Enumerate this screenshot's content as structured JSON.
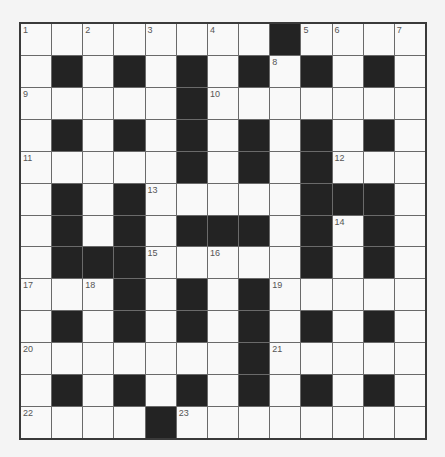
{
  "puzzle": {
    "rows": 13,
    "cols": 13,
    "grid": [
      "........#....",
      ".#.#.#.#.#.#.",
      ".....#.......",
      ".#.#.#.#.#.#.",
      ".....#.#.#...",
      ".#.#.....###.",
      ".#.#.###.#.#.",
      ".###.....#.#.",
      "...#.#.#.....",
      ".#.#.#.#.#.#.",
      ".......#.....",
      ".#.#.#.#.#.#.",
      "....#........"
    ],
    "numbers": [
      {
        "r": 0,
        "c": 0,
        "n": "1"
      },
      {
        "r": 0,
        "c": 2,
        "n": "2"
      },
      {
        "r": 0,
        "c": 4,
        "n": "3"
      },
      {
        "r": 0,
        "c": 6,
        "n": "4"
      },
      {
        "r": 0,
        "c": 9,
        "n": "5"
      },
      {
        "r": 0,
        "c": 10,
        "n": "6"
      },
      {
        "r": 0,
        "c": 12,
        "n": "7"
      },
      {
        "r": 1,
        "c": 8,
        "n": "8"
      },
      {
        "r": 2,
        "c": 0,
        "n": "9"
      },
      {
        "r": 2,
        "c": 6,
        "n": "10"
      },
      {
        "r": 4,
        "c": 0,
        "n": "11"
      },
      {
        "r": 4,
        "c": 10,
        "n": "12"
      },
      {
        "r": 5,
        "c": 4,
        "n": "13"
      },
      {
        "r": 6,
        "c": 10,
        "n": "14"
      },
      {
        "r": 7,
        "c": 4,
        "n": "15"
      },
      {
        "r": 7,
        "c": 6,
        "n": "16"
      },
      {
        "r": 8,
        "c": 0,
        "n": "17"
      },
      {
        "r": 8,
        "c": 2,
        "n": "18"
      },
      {
        "r": 8,
        "c": 8,
        "n": "19"
      },
      {
        "r": 10,
        "c": 0,
        "n": "20"
      },
      {
        "r": 10,
        "c": 8,
        "n": "21"
      },
      {
        "r": 12,
        "c": 0,
        "n": "22"
      },
      {
        "r": 12,
        "c": 5,
        "n": "23"
      }
    ],
    "letters": []
  },
  "colors": {
    "block": "#232323",
    "cell": "#f9f9f9",
    "gridline": "#6a6a6a",
    "border": "#3a3a3a",
    "number": "#555555",
    "background": "#f4f4f4"
  }
}
